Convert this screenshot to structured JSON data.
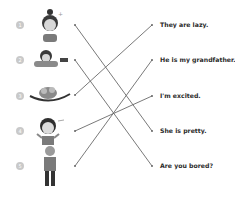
{
  "exercise": {
    "type": "matching",
    "items": [
      {
        "number": "1",
        "picture": "girl-with-bun"
      },
      {
        "number": "2",
        "picture": "girl-lying-down"
      },
      {
        "number": "3",
        "picture": "sloths-on-branch"
      },
      {
        "number": "4",
        "picture": "excited-boy"
      },
      {
        "number": "5",
        "picture": "old-man"
      }
    ],
    "sentences": [
      "They are lazy.",
      "He is my grandfather.",
      "I'm excited.",
      "She is pretty.",
      "Are you bored?"
    ],
    "matches": [
      {
        "item": 1,
        "sentence": 4
      },
      {
        "item": 2,
        "sentence": 5
      },
      {
        "item": 3,
        "sentence": 1
      },
      {
        "item": 4,
        "sentence": 3
      },
      {
        "item": 5,
        "sentence": 2
      }
    ],
    "colors": {
      "line": "#6a6a6a",
      "number_circle": "#c9c9c9",
      "text": "#2a2a2a"
    }
  }
}
